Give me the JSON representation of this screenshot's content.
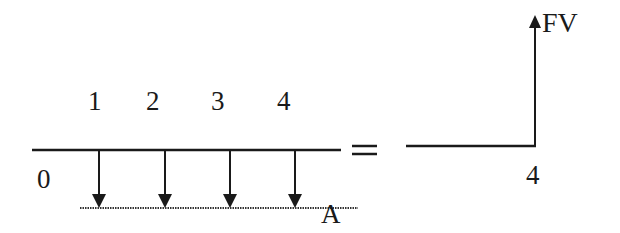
{
  "diagram": {
    "type": "cash-flow-timeline-equivalence",
    "left": {
      "period_labels": [
        "1",
        "2",
        "3",
        "4"
      ],
      "origin_label": "0",
      "payment_label": "A",
      "payment_count": 4,
      "payment_direction": "down"
    },
    "equals_sign": "=",
    "right": {
      "end_period_label": "4",
      "value_label": "FV",
      "value_direction": "up"
    },
    "colors": {
      "ink": "#1a1a1a",
      "background": "#ffffff"
    }
  }
}
